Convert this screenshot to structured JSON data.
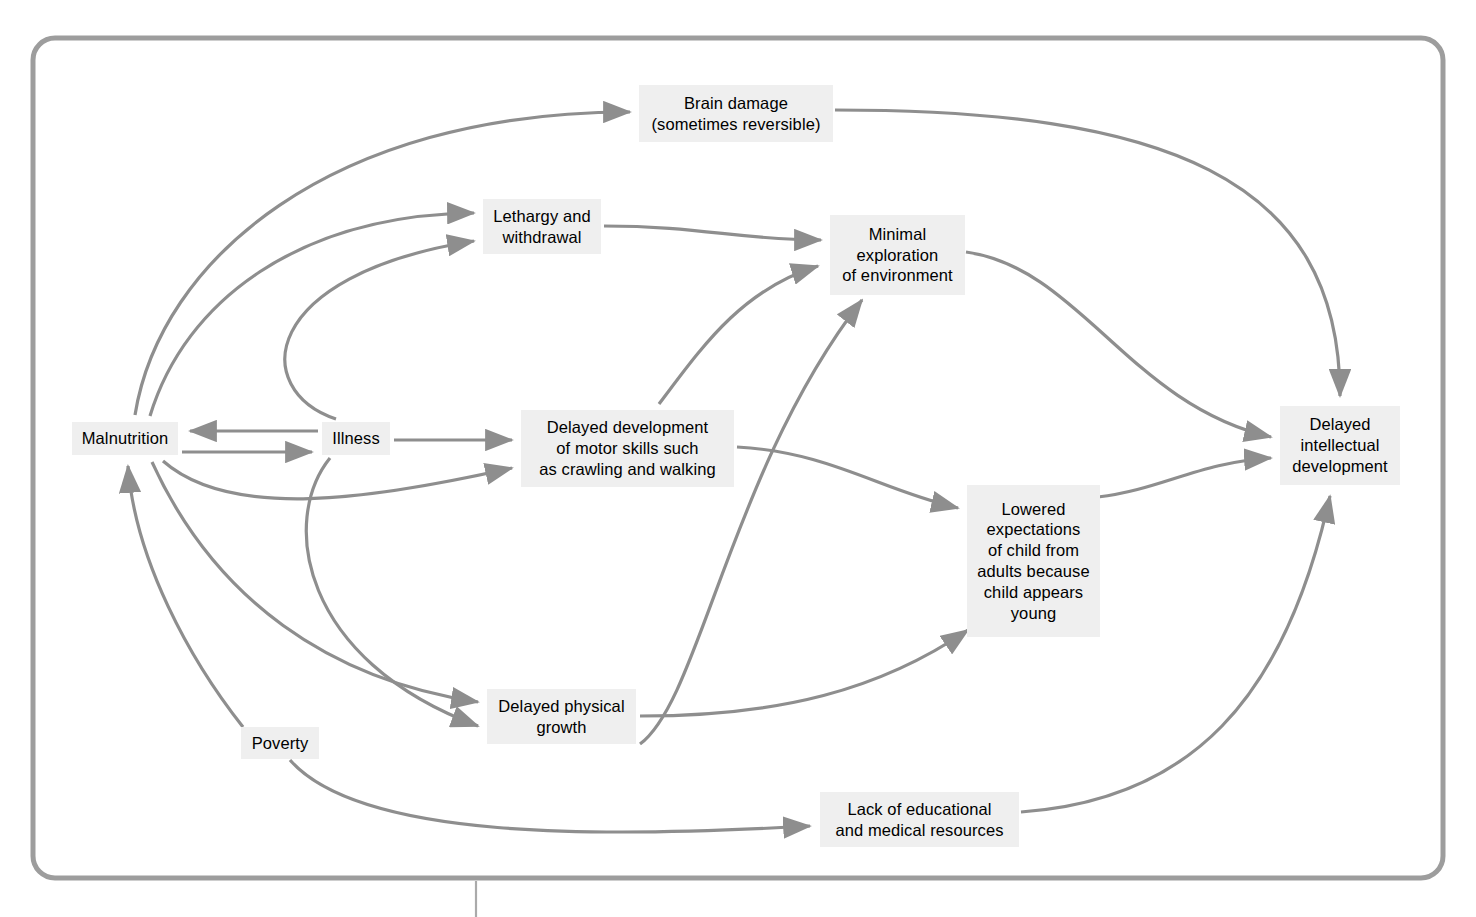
{
  "figure": {
    "type": "flow-diagram",
    "title": "",
    "frame": {
      "border_color": "#9d9d9d",
      "background": "#ffffff",
      "corner_radius": 22
    },
    "style": {
      "node_fill": "#efefef",
      "node_text_color": "#000000",
      "edge_color": "#8e8e8e"
    }
  },
  "nodes": [
    {
      "id": "brain-damage",
      "label": "Brain damage\n(sometimes reversible)",
      "x": 639,
      "y": 85,
      "w": 194,
      "h": 57
    },
    {
      "id": "lethargy",
      "label": "Lethargy and\nwithdrawal",
      "x": 483,
      "y": 199,
      "w": 118,
      "h": 55
    },
    {
      "id": "minimal-exploration",
      "label": "Minimal\nexploration\nof environment",
      "x": 830,
      "y": 215,
      "w": 135,
      "h": 80
    },
    {
      "id": "malnutrition",
      "label": "Malnutrition",
      "x": 72,
      "y": 422,
      "w": 106,
      "h": 33
    },
    {
      "id": "illness",
      "label": "Illness",
      "x": 322,
      "y": 422,
      "w": 68,
      "h": 33
    },
    {
      "id": "motor-skills",
      "label": "Delayed development\nof motor skills such\nas crawling and walking",
      "x": 521,
      "y": 410,
      "w": 213,
      "h": 77
    },
    {
      "id": "delayed-intellectual",
      "label": "Delayed\nintellectual\ndevelopment",
      "x": 1280,
      "y": 406,
      "w": 120,
      "h": 79
    },
    {
      "id": "lowered-expectations",
      "label": "Lowered\nexpectations\nof child from\nadults because\nchild appears\nyoung",
      "x": 967,
      "y": 485,
      "w": 133,
      "h": 152
    },
    {
      "id": "delayed-growth",
      "label": "Delayed physical\ngrowth",
      "x": 487,
      "y": 689,
      "w": 149,
      "h": 55
    },
    {
      "id": "poverty",
      "label": "Poverty",
      "x": 241,
      "y": 727,
      "w": 78,
      "h": 32
    },
    {
      "id": "lack-resources",
      "label": "Lack of educational\nand medical resources",
      "x": 820,
      "y": 792,
      "w": 199,
      "h": 55
    }
  ],
  "edges": [
    {
      "from": "malnutrition",
      "to": "brain-damage",
      "kind": "curve"
    },
    {
      "from": "malnutrition",
      "to": "lethargy",
      "kind": "curve"
    },
    {
      "from": "illness",
      "to": "lethargy",
      "kind": "curve"
    },
    {
      "from": "malnutrition",
      "to": "illness",
      "kind": "straight"
    },
    {
      "from": "illness",
      "to": "malnutrition",
      "kind": "straight"
    },
    {
      "from": "illness",
      "to": "motor-skills",
      "kind": "straight"
    },
    {
      "from": "malnutrition",
      "to": "motor-skills",
      "kind": "curve"
    },
    {
      "from": "malnutrition",
      "to": "delayed-growth",
      "kind": "curve"
    },
    {
      "from": "illness",
      "to": "delayed-growth",
      "kind": "curve"
    },
    {
      "from": "poverty",
      "to": "malnutrition",
      "kind": "curve"
    },
    {
      "from": "poverty",
      "to": "lack-resources",
      "kind": "curve"
    },
    {
      "from": "lethargy",
      "to": "minimal-exploration",
      "kind": "curve"
    },
    {
      "from": "motor-skills",
      "to": "minimal-exploration",
      "kind": "curve"
    },
    {
      "from": "delayed-growth",
      "to": "minimal-exploration",
      "kind": "curve"
    },
    {
      "from": "motor-skills",
      "to": "lowered-expectations",
      "kind": "curve"
    },
    {
      "from": "delayed-growth",
      "to": "lowered-expectations",
      "kind": "curve"
    },
    {
      "from": "minimal-exploration",
      "to": "delayed-intellectual",
      "kind": "curve"
    },
    {
      "from": "lowered-expectations",
      "to": "delayed-intellectual",
      "kind": "curve"
    },
    {
      "from": "brain-damage",
      "to": "delayed-intellectual",
      "kind": "curve"
    },
    {
      "from": "lack-resources",
      "to": "delayed-intellectual",
      "kind": "curve"
    }
  ]
}
